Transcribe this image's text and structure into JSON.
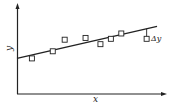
{
  "chart_data": {
    "type": "scatter",
    "title": "",
    "xlabel": "x",
    "ylabel": "y",
    "grid": false,
    "legend": null,
    "axes": {
      "x_ticks": [],
      "y_ticks": [],
      "arrows": true
    },
    "series": [
      {
        "name": "data points",
        "marker": "open-square",
        "points": [
          {
            "x": 0.1,
            "y": 0.4
          },
          {
            "x": 0.24,
            "y": 0.48
          },
          {
            "x": 0.32,
            "y": 0.61
          },
          {
            "x": 0.46,
            "y": 0.63
          },
          {
            "x": 0.56,
            "y": 0.56
          },
          {
            "x": 0.63,
            "y": 0.62
          },
          {
            "x": 0.7,
            "y": 0.68
          },
          {
            "x": 0.87,
            "y": 0.62
          }
        ]
      },
      {
        "name": "fit line",
        "type": "line",
        "points": [
          {
            "x": 0.0,
            "y": 0.4
          },
          {
            "x": 0.94,
            "y": 0.76
          }
        ]
      }
    ],
    "annotations": [
      {
        "text": "Δy",
        "description": "vertical residual between fit line and last data point",
        "x": 0.87
      }
    ]
  },
  "labels": {
    "x": "x",
    "y": "y",
    "delta": "Δy"
  },
  "style": {
    "ink": "#222222",
    "background": "#ffffff"
  }
}
